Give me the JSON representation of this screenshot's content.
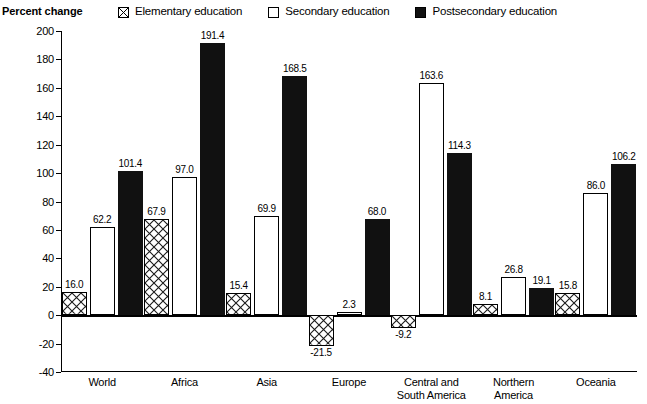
{
  "chart_data": {
    "type": "bar",
    "title": "",
    "xlabel": "",
    "ylabel": "Percent change",
    "ylim": [
      -40,
      200
    ],
    "ytick_step": 20,
    "yticks": [
      200,
      180,
      160,
      140,
      120,
      100,
      80,
      60,
      40,
      20,
      0,
      -20,
      -40
    ],
    "ytick_labels": [
      "200",
      "180",
      "160",
      "140",
      "120",
      "100",
      "80",
      "60",
      "40",
      "20",
      "0",
      "-20",
      "-40"
    ],
    "grid": false,
    "legend_position": "top",
    "categories": [
      "World",
      "Africa",
      "Asia",
      "Europe",
      "Central and\nSouth America",
      "Northern\nAmerica",
      "Oceania"
    ],
    "series": [
      {
        "name": "Elementary education",
        "style": "crosshatch",
        "values": [
          16.0,
          67.9,
          15.4,
          -21.5,
          -9.2,
          8.1,
          15.8
        ],
        "labels": [
          "16.0",
          "67.9",
          "15.4",
          "-21.5",
          "-9.2",
          "8.1",
          "15.8"
        ]
      },
      {
        "name": "Secondary education",
        "style": "open",
        "values": [
          62.2,
          97.0,
          69.9,
          2.3,
          163.6,
          26.8,
          86.0
        ],
        "labels": [
          "62.2",
          "97.0",
          "69.9",
          "2.3",
          "163.6",
          "26.8",
          "86.0"
        ]
      },
      {
        "name": "Postsecondary education",
        "style": "solid",
        "values": [
          101.4,
          191.4,
          168.5,
          68.0,
          114.3,
          19.1,
          106.2
        ],
        "labels": [
          "101.4",
          "191.4",
          "168.5",
          "68.0",
          "114.3",
          "19.1",
          "106.2"
        ]
      }
    ]
  },
  "axis": {
    "y_title": "Percent change"
  },
  "legend": {
    "items": [
      {
        "label": "Elementary education",
        "swatch": "crosshatch-swatch-icon"
      },
      {
        "label": "Secondary education",
        "swatch": "open-square-swatch-icon"
      },
      {
        "label": "Postsecondary education",
        "swatch": "solid-square-swatch-icon"
      }
    ]
  },
  "colors": {
    "ink": "#000000",
    "solid_fill": "#111111",
    "open_fill": "#ffffff"
  }
}
